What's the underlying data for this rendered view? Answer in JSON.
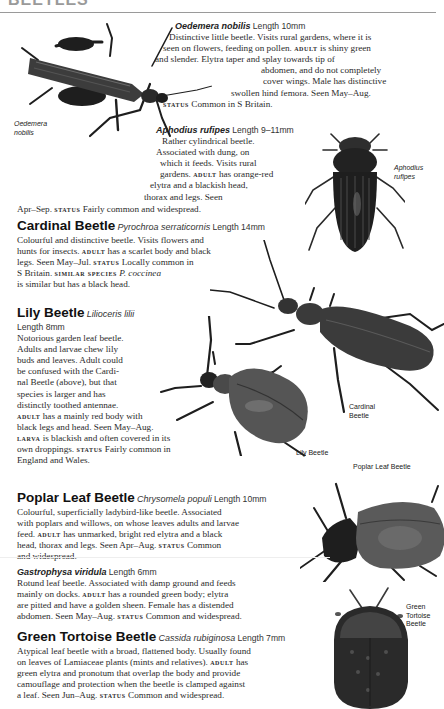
{
  "page": {
    "header_fragment": "BEETLES"
  },
  "entries": [
    {
      "id": "oedemera",
      "common_name": "",
      "scientific_name": "Oedemera nobilis",
      "length": "Length 10mm",
      "lines": [
        "Distinctive little beetle. Visits rural gardens, where it is",
        "seen on flowers, feeding on pollen.",
        "is shiny green",
        "and slender. Elytra taper and splay towards tip of",
        "abdomen, and do not completely",
        "cover wings. Male has distinctive",
        "swollen hind femora. Seen May–Aug.",
        "Common in S Britain."
      ],
      "labels": {
        "adult": "adult",
        "status": "status"
      },
      "caption": [
        "Oedemera",
        "nobilis"
      ]
    },
    {
      "id": "aphodius",
      "common_name": "",
      "scientific_name": "Aphodius rufipes",
      "length": "Length 9–11mm",
      "lines": [
        "Rather cylindrical beetle.",
        "Associated with dung, on",
        "which it feeds. Visits rural",
        "gardens.",
        "has orange-red",
        "elytra and a blackish head,",
        "thorax and legs. Seen",
        "Apr–Sep.",
        "Fairly common and widespread."
      ],
      "labels": {
        "adult": "adult",
        "status": "status"
      },
      "caption": [
        "Aphodius",
        "rufipes"
      ]
    },
    {
      "id": "cardinal",
      "common_name": "Cardinal Beetle",
      "scientific_name": "Pyrochroa serraticornis",
      "length": "Length 14mm",
      "lines": [
        "Colourful and distinctive beetle. Visits flowers and",
        "hunts for insects.",
        "has a scarlet body and black",
        "legs. Seen May–Jul.",
        "Locally common in",
        "S Britain.",
        "P. coccinea",
        "is similar but has a black head."
      ],
      "labels": {
        "adult": "adult",
        "status": "status",
        "similar": "similar species"
      },
      "caption": [
        "Cardinal",
        "Beetle"
      ]
    },
    {
      "id": "lily",
      "common_name": "Lily Beetle",
      "scientific_name": "Lilioceris lilii",
      "length": "Length 8mm",
      "lines": [
        "Notorious garden leaf beetle.",
        "Adults and larvae chew lily",
        "buds and leaves. Adult could",
        "be confused with the Cardi-",
        "nal Beetle (above), but that",
        "species is larger and has",
        "distinctly toothed antennae.",
        "has a mainly red body with",
        "black legs and head. Seen May–Aug.",
        "is blackish and often covered in its",
        "own droppings.",
        "Fairly common in",
        "England and Wales."
      ],
      "labels": {
        "adult": "adult",
        "larva": "larva",
        "status": "status"
      },
      "caption": [
        "Lily Beetle"
      ]
    },
    {
      "id": "poplar",
      "common_name": "Poplar Leaf Beetle",
      "scientific_name": "Chrysomela populi",
      "length": "Length 10mm",
      "lines": [
        "Colourful, superficially ladybird-like beetle. Associated",
        "with poplars and willows, on whose leaves adults and larvae",
        "feed.",
        "has unmarked, bright red elytra and a black",
        "head, thorax and legs. Seen Apr–Aug.",
        "Common",
        "and widespread."
      ],
      "labels": {
        "adult": "adult",
        "status": "status"
      },
      "caption": [
        "Poplar Leaf Beetle"
      ]
    },
    {
      "id": "gastrophysa",
      "common_name": "",
      "scientific_name": "Gastrophysa viridula",
      "length": "Length 6mm",
      "lines": [
        "Rotund leaf beetle. Associated with damp ground and feeds",
        "mainly on docks.",
        "has a rounded green body; elytra",
        "are pitted and have a golden sheen. Female has a distended",
        "abdomen. Seen May–Aug.",
        "Common and widespread."
      ],
      "labels": {
        "adult": "adult",
        "status": "status"
      }
    },
    {
      "id": "tortoise",
      "common_name": "Green Tortoise Beetle",
      "scientific_name": "Cassida rubiginosa",
      "length": "Length 7mm",
      "lines": [
        "Atypical leaf beetle with a broad, flattened body. Usually found",
        "on leaves of Lamiaceae plants (mints and relatives).",
        "has",
        "green elytra and pronotum that overlap the body and provide",
        "camouflage and protection when the beetle is clamped against",
        "a leaf. Seen Jun–Aug.",
        "Common and widespread."
      ],
      "labels": {
        "adult": "adult",
        "status": "status"
      },
      "caption": [
        "Green",
        "Tortoise",
        "Beetle"
      ]
    }
  ],
  "colors": {
    "text": "#2b2b2b",
    "rule": "#9a9a9a",
    "beetle_dark": "#1e1e1e",
    "beetle_mid": "#4a4a4a",
    "beetle_light": "#6e6e6e"
  }
}
